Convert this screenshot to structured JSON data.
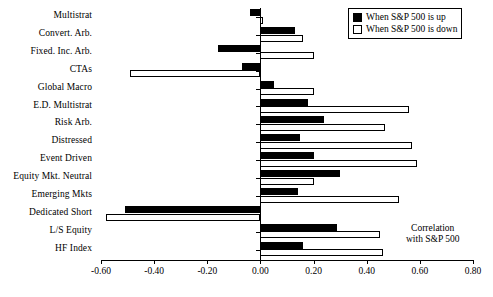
{
  "legend": {
    "up_label": "When S&P 500 is up",
    "down_label": "When S&P 500 is down"
  },
  "annotation": {
    "line1": "Correlation",
    "line2": "with S&P 500"
  },
  "axis": {
    "tick_labels": [
      "-0.60",
      "-0.40",
      "-0.20",
      "0.00",
      "0.20",
      "0.40",
      "0.60",
      "0.80"
    ]
  },
  "chart_data": {
    "type": "bar",
    "orientation": "horizontal",
    "title": "",
    "xlabel": "Correlation with S&P 500",
    "ylabel": "",
    "xlim": [
      -0.6,
      0.8
    ],
    "xticks": [
      -0.6,
      -0.4,
      -0.2,
      0.0,
      0.2,
      0.4,
      0.6,
      0.8
    ],
    "grid": false,
    "legend_position": "top-right",
    "categories": [
      "Multistrat",
      "Convert. Arb.",
      "Fixed. Inc. Arb.",
      "CTAs",
      "Global Macro",
      "E.D. Multistrat",
      "Risk Arb.",
      "Distressed",
      "Event Driven",
      "Equity Mkt. Neutral",
      "Emerging Mkts",
      "Dedicated Short",
      "L/S Equity",
      "HF Index"
    ],
    "series": [
      {
        "name": "When S&P 500 is up",
        "color": "#000000",
        "values": [
          -0.04,
          0.13,
          -0.16,
          -0.07,
          0.05,
          0.18,
          0.24,
          0.15,
          0.2,
          0.3,
          0.14,
          -0.51,
          0.29,
          0.16
        ]
      },
      {
        "name": "When S&P 500 is down",
        "color": "#ffffff",
        "values": [
          0.01,
          0.16,
          0.2,
          -0.49,
          0.2,
          0.56,
          0.47,
          0.57,
          0.59,
          0.2,
          0.52,
          -0.58,
          0.45,
          0.46
        ]
      }
    ]
  }
}
